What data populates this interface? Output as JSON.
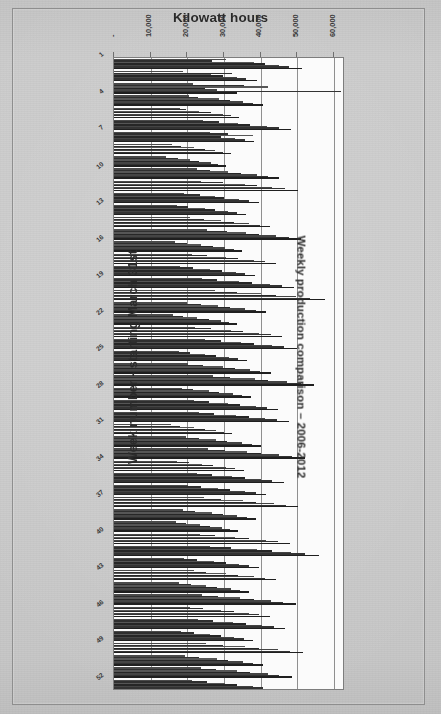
{
  "figure": {
    "background_color": "#cbcbcb",
    "plot_background_color": "#fbfbfb",
    "frame_color": "#8e8e8e",
    "bar_color": "#3a3a3a"
  },
  "chart_data": {
    "type": "bar",
    "orientation": "horizontal",
    "title": "Kilowatt hours",
    "xlabel": "Kilowatt hours",
    "ylabel": "Week number - starting March 31st",
    "right_title": "Weekly production comparison – 2006-2012",
    "grid": true,
    "legend": null,
    "legend_position": "none",
    "xlim": [
      0,
      63000
    ],
    "xticklabels": [
      "-",
      "10,000",
      "20,000",
      "30,000",
      "40,000",
      "50,000",
      "60,000"
    ],
    "xticks": [
      0,
      10000,
      20000,
      30000,
      40000,
      50000,
      60000
    ],
    "categories": [
      "1",
      "2",
      "3",
      "4",
      "5",
      "6",
      "7",
      "8",
      "9",
      "10",
      "11",
      "12",
      "13",
      "14",
      "15",
      "16",
      "17",
      "18",
      "19",
      "20",
      "21",
      "22",
      "23",
      "24",
      "25",
      "26",
      "27",
      "28",
      "29",
      "30",
      "31",
      "32",
      "33",
      "34",
      "35",
      "36",
      "37",
      "38",
      "39",
      "40",
      "41",
      "42",
      "43",
      "44",
      "45",
      "46",
      "47",
      "48",
      "49",
      "50",
      "51",
      "52"
    ],
    "yticklabels_shown": [
      "1",
      "4",
      "7",
      "10",
      "13",
      "16",
      "19",
      "22",
      "25",
      "28",
      "31",
      "34",
      "37",
      "40",
      "43",
      "46",
      "49",
      "52"
    ],
    "series": [
      {
        "name": "2006",
        "values": [
          30500,
          18800,
          21600,
          20400,
          17900,
          24300,
          26100,
          15900,
          14200,
          22700,
          23800,
          19200,
          17300,
          20800,
          25400,
          16700,
          21300,
          18100,
          23900,
          27600,
          19800,
          16200,
          22100,
          24800,
          17600,
          20300,
          26900,
          18400,
          21900,
          23100,
          15400,
          19600,
          25700,
          17200,
          22500,
          20100,
          24600,
          18900,
          16800,
          23400,
          26300,
          19100,
          21700,
          17800,
          24100,
          20600,
          22800,
          18300,
          25100,
          19400,
          23700,
          21200
        ]
      },
      {
        "name": "2007",
        "values": [
          26800,
          32100,
          35400,
          22900,
          19600,
          28700,
          31200,
          18300,
          17400,
          26100,
          29800,
          23500,
          20100,
          24600,
          30700,
          19800,
          25300,
          21600,
          28100,
          33400,
          23700,
          18900,
          26400,
          29100,
          20800,
          24200,
          31600,
          21400,
          25800,
          27300,
          18100,
          23100,
          30200,
          20400,
          26700,
          23800,
          29300,
          22100,
          19700,
          27400,
          31900,
          22600,
          25100,
          20900,
          28400,
          24300,
          26900,
          21800,
          29600,
          23200,
          27800,
          25400
        ]
      },
      {
        "name": "2008",
        "values": [
          38200,
          26400,
          42100,
          28600,
          23100,
          33900,
          37800,
          21700,
          20600,
          31200,
          35600,
          27400,
          24800,
          29300,
          36100,
          23600,
          30400,
          26100,
          34200,
          40100,
          28300,
          22700,
          31800,
          34700,
          24900,
          29600,
          38400,
          25800,
          31100,
          33200,
          21900,
          27800,
          36300,
          24100,
          32100,
          28400,
          35100,
          26700,
          23400,
          33100,
          38900,
          27200,
          30600,
          25100,
          34400,
          29200,
          32400,
          26300,
          35800,
          28100,
          33600,
          30200
        ]
      },
      {
        "name": "2009",
        "values": [
          41300,
          29800,
          24900,
          31700,
          26400,
          37100,
          29200,
          24800,
          23100,
          34600,
          38900,
          30100,
          27600,
          32800,
          39400,
          26900,
          33700,
          29400,
          37600,
          44200,
          31600,
          25800,
          35100,
          38200,
          27900,
          32900,
          42100,
          28600,
          34400,
          36700,
          24700,
          30900,
          40100,
          27100,
          35600,
          31700,
          38700,
          29800,
          26100,
          36800,
          43100,
          30400,
          33900,
          28200,
          38100,
          32600,
          35900,
          29100,
          39600,
          31200,
          37200,
          33600
        ]
      },
      {
        "name": "2010",
        "values": [
          44900,
          33600,
          28100,
          35200,
          29700,
          41600,
          33100,
          27600,
          26400,
          38900,
          43200,
          34100,
          31200,
          36900,
          44100,
          30200,
          38100,
          33200,
          42400,
          49600,
          35800,
          29100,
          39600,
          43100,
          31400,
          37100,
          47200,
          32400,
          38800,
          41200,
          27900,
          34800,
          45100,
          30600,
          40100,
          35800,
          43600,
          33600,
          29400,
          41400,
          48300,
          34200,
          38200,
          31800,
          42900,
          36700,
          40400,
          32800,
          44600,
          35100,
          41900,
          37800
        ]
      },
      {
        "name": "2011",
        "values": [
          47600,
          36100,
          61800,
          37800,
          31900,
          44900,
          35600,
          29800,
          28400,
          41900,
          46600,
          36800,
          33600,
          39700,
          47600,
          32600,
          41100,
          35800,
          45700,
          53400,
          38600,
          31400,
          42700,
          46400,
          33800,
          39900,
          50900,
          34900,
          41800,
          44400,
          30100,
          37500,
          48600,
          33000,
          43200,
          38600,
          46900,
          36200,
          31700,
          44600,
          52100,
          36800,
          41200,
          34300,
          46200,
          39500,
          43500,
          35400,
          48100,
          37800,
          45100,
          40700
        ]
      },
      {
        "name": "2012",
        "values": [
          51200,
          38900,
          33400,
          40600,
          34100,
          48200,
          38100,
          31900,
          30400,
          44900,
          50100,
          39400,
          35900,
          42600,
          51100,
          34900,
          44100,
          38400,
          49100,
          57400,
          41400,
          33600,
          45800,
          49800,
          36200,
          42800,
          54600,
          37400,
          44800,
          47700,
          32300,
          40200,
          52200,
          35400,
          46400,
          41400,
          50300,
          38800,
          33900,
          47900,
          55900,
          39500,
          44200,
          36800,
          49600,
          42400,
          46700,
          37900,
          51600,
          40600,
          48400,
          43700
        ]
      }
    ]
  }
}
